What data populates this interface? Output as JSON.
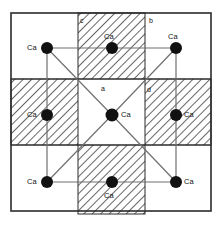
{
  "figure": {
    "background_color": "#ffffff",
    "border_color": "#2b2b2b",
    "line_color": "#6f6f6f",
    "atom_color": "#111111",
    "hatch_color": "#555555",
    "frame": {
      "x": 11,
      "y": 13,
      "width": 200,
      "height": 198
    }
  },
  "grid": {
    "columns": [
      11,
      78,
      145,
      211
    ],
    "rows": [
      13,
      79,
      145,
      211
    ],
    "hatched_cells": [
      {
        "name": "top-middle",
        "x": 78,
        "y": 13,
        "width": 67,
        "height": 66
      },
      {
        "name": "middle-left",
        "x": 11,
        "y": 79,
        "width": 67,
        "height": 66
      },
      {
        "name": "middle-right",
        "x": 145,
        "y": 79,
        "width": 66,
        "height": 66
      },
      {
        "name": "bottom-middle",
        "x": 78,
        "y": 145,
        "width": 67,
        "height": 69
      }
    ]
  },
  "atoms": [
    {
      "id": "atom-top-left",
      "label": "Ca",
      "cx": 47,
      "cy": 48,
      "r": 6.0,
      "label_x": 27,
      "label_y": 44
    },
    {
      "id": "atom-top-middle",
      "label": "Ca",
      "cx": 112,
      "cy": 48,
      "r": 6.0,
      "label_x": 104,
      "label_y": 33
    },
    {
      "id": "atom-top-right",
      "label": "Ca",
      "cx": 176,
      "cy": 48,
      "r": 6.0,
      "label_x": 168,
      "label_y": 33
    },
    {
      "id": "atom-middle-left",
      "label": "Ca",
      "cx": 47,
      "cy": 115,
      "r": 6.0,
      "label_x": 27,
      "label_y": 111
    },
    {
      "id": "atom-center",
      "label": "Ca",
      "cx": 112,
      "cy": 115,
      "r": 6.5,
      "label_x": 121,
      "label_y": 111
    },
    {
      "id": "atom-middle-right",
      "label": "Ca",
      "cx": 176,
      "cy": 115,
      "r": 6.0,
      "label_x": 184,
      "label_y": 111
    },
    {
      "id": "atom-bottom-left",
      "label": "Ca",
      "cx": 47,
      "cy": 182,
      "r": 6.0,
      "label_x": 27,
      "label_y": 178
    },
    {
      "id": "atom-bottom-middle",
      "label": "Ca",
      "cx": 112,
      "cy": 182,
      "r": 6.0,
      "label_x": 104,
      "label_y": 192
    },
    {
      "id": "atom-bottom-right",
      "label": "Ca",
      "cx": 176,
      "cy": 182,
      "r": 6.0,
      "label_x": 184,
      "label_y": 178
    }
  ],
  "axis_labels": [
    {
      "id": "label-c",
      "text": "c",
      "x": 80,
      "y": 17
    },
    {
      "id": "label-b",
      "text": "b",
      "x": 149,
      "y": 17
    },
    {
      "id": "label-a",
      "text": "a",
      "x": 101,
      "y": 85
    },
    {
      "id": "label-d",
      "text": "d",
      "x": 147,
      "y": 86
    }
  ],
  "connections": {
    "description": "Inner square edges joining outer Ca atoms plus diagonals from the centre Ca atom",
    "square": [
      [
        47,
        48
      ],
      [
        176,
        48
      ],
      [
        176,
        182
      ],
      [
        47,
        182
      ]
    ],
    "horizontals": [
      {
        "x1": 47,
        "y1": 48,
        "x2": 176,
        "y2": 48
      },
      {
        "x1": 47,
        "y1": 182,
        "x2": 176,
        "y2": 182
      }
    ],
    "verticals": [
      {
        "x1": 47,
        "y1": 48,
        "x2": 47,
        "y2": 182
      },
      {
        "x1": 176,
        "y1": 48,
        "x2": 176,
        "y2": 182
      }
    ],
    "diagonals": [
      {
        "x1": 47,
        "y1": 48,
        "x2": 112,
        "y2": 115
      },
      {
        "x1": 176,
        "y1": 48,
        "x2": 112,
        "y2": 115
      },
      {
        "x1": 47,
        "y1": 182,
        "x2": 112,
        "y2": 115
      },
      {
        "x1": 176,
        "y1": 182,
        "x2": 112,
        "y2": 115
      }
    ]
  }
}
